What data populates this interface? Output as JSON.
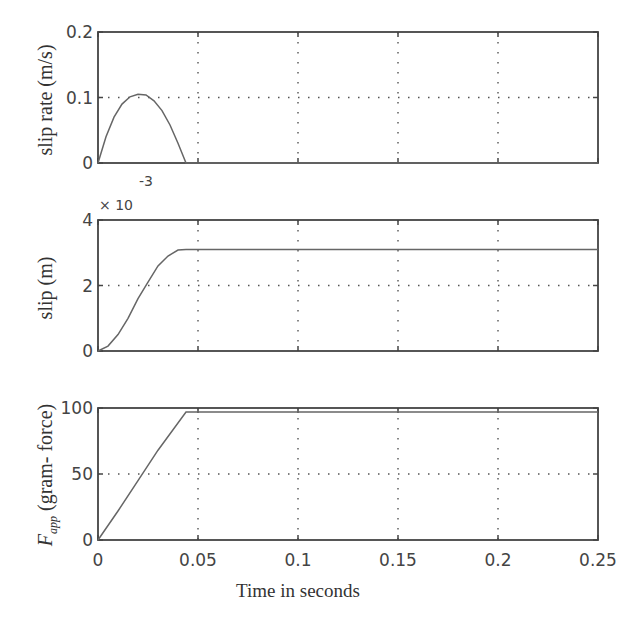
{
  "figure": {
    "xlabel": "Time  in seconds",
    "x_ticks": [
      "0",
      "0.05",
      "0.1",
      "0.15",
      "0.2",
      "0.25"
    ]
  },
  "panels": [
    {
      "ylabel": "slip rate (m/s)",
      "y_ticks": [
        "0",
        "0.1",
        "0.2"
      ],
      "exponent_base": "× 10",
      "exponent_power": ""
    },
    {
      "ylabel": "slip (m)",
      "y_ticks": [
        "0",
        "2",
        "4"
      ],
      "exponent_base": "× 10",
      "exponent_power": "-3"
    },
    {
      "ylabel_symbol": "F",
      "ylabel_subscript": "app",
      "ylabel": "(gram- force)",
      "y_ticks": [
        "0",
        "50",
        "100"
      ]
    }
  ],
  "chart_data": [
    {
      "type": "line",
      "title": "",
      "xlabel": "",
      "ylabel": "slip rate (m/s)",
      "xlim": [
        0,
        0.25
      ],
      "ylim": [
        0,
        0.2
      ],
      "grid": true,
      "x": [
        0,
        0.004,
        0.008,
        0.012,
        0.016,
        0.02,
        0.024,
        0.028,
        0.032,
        0.036,
        0.04,
        0.044,
        0.1,
        0.15,
        0.2,
        0.25
      ],
      "y": [
        0,
        0.04,
        0.07,
        0.09,
        0.101,
        0.105,
        0.104,
        0.095,
        0.08,
        0.058,
        0.03,
        0,
        0,
        0,
        0,
        0
      ]
    },
    {
      "type": "line",
      "title": "",
      "xlabel": "",
      "ylabel": "slip (m)",
      "y_scale_multiplier": "1e-3",
      "xlim": [
        0,
        0.25
      ],
      "ylim": [
        0,
        4
      ],
      "grid": true,
      "x": [
        0,
        0.005,
        0.01,
        0.015,
        0.02,
        0.025,
        0.03,
        0.035,
        0.04,
        0.044,
        0.1,
        0.15,
        0.2,
        0.25
      ],
      "y": [
        0,
        0.15,
        0.5,
        1.0,
        1.6,
        2.1,
        2.6,
        2.9,
        3.08,
        3.1,
        3.1,
        3.1,
        3.1,
        3.1
      ]
    },
    {
      "type": "line",
      "title": "",
      "xlabel": "Time  in seconds",
      "ylabel": "F_app (gram- force)",
      "xlim": [
        0,
        0.25
      ],
      "ylim": [
        0,
        100
      ],
      "grid": true,
      "x": [
        0,
        0.01,
        0.02,
        0.03,
        0.044,
        0.1,
        0.15,
        0.2,
        0.25
      ],
      "y": [
        0,
        22,
        45,
        68,
        97,
        97,
        97,
        97,
        97
      ]
    }
  ]
}
